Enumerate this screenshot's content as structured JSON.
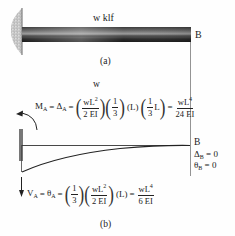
{
  "figure_a": {
    "load_label": "w klf",
    "end_label": "B",
    "caption": "(a)"
  },
  "figure_b": {
    "load_label": "w",
    "end_label": "B",
    "moment_eq": {
      "lhs_M": "M",
      "lhs_M_sub": "A",
      "eq1": "=",
      "lhs_D": "Δ",
      "lhs_D_sub": "A",
      "eq2": "=",
      "f1_num": "wL",
      "f1_num_sup": "2",
      "f1_den": "2 EI",
      "f2_num": "1",
      "f2_den": "3",
      "term_L": "(L)",
      "f3_num": "1",
      "f3_den": "3",
      "f3_after": "L",
      "eq3": "=",
      "res_num": "wL",
      "res_num_sup": "4",
      "res_den": "24 EI"
    },
    "shear_eq": {
      "lhs_V": "V",
      "lhs_V_sub": "A",
      "eq1": "=",
      "lhs_T": "θ",
      "lhs_T_sub": "A",
      "eq2": "=",
      "f1_num": "1",
      "f1_den": "3",
      "f2_num": "wL",
      "f2_num_sup": "2",
      "f2_den": "2 EI",
      "term_L": "(L)",
      "eq3": "=",
      "res_num": "wL",
      "res_num_sup": "4",
      "res_den": "6 EI"
    },
    "boundary": {
      "delta_sym": "Δ",
      "delta_sub": "B",
      "delta_val": "= 0",
      "theta_sym": "θ",
      "theta_sub": "B",
      "theta_val": "= 0"
    },
    "caption": "(b)"
  }
}
